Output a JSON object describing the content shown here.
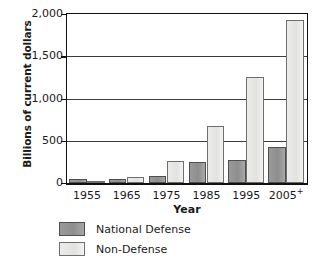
{
  "chart_data": {
    "type": "bar",
    "title": "",
    "xlabel": "Year",
    "ylabel": "Billions of current dollars",
    "categories": [
      "1955",
      "1965",
      "1975",
      "1985",
      "1995",
      "2005+"
    ],
    "category_labels_html": [
      "1955",
      "1965",
      "1975",
      "1985",
      "1995",
      "2005"
    ],
    "series": [
      {
        "name": "National Defense",
        "color": "#8e8e8e",
        "values": [
          43,
          51,
          87,
          253,
          273,
          430
        ]
      },
      {
        "name": "Non-Defense",
        "color": "#e2e2e0",
        "values": [
          25,
          67,
          260,
          680,
          1250,
          1930
        ]
      }
    ],
    "ylim": [
      0,
      2000
    ],
    "yticks": [
      0,
      500,
      1000,
      1500,
      2000
    ],
    "ytick_labels": [
      "0",
      "500",
      "1,000",
      "1,500",
      "2,000"
    ],
    "grid": true,
    "legend_position": "bottom-left",
    "last_category_superscript": "+"
  },
  "legend": {
    "items": [
      {
        "label": "National Defense"
      },
      {
        "label": "Non-Defense"
      }
    ]
  }
}
